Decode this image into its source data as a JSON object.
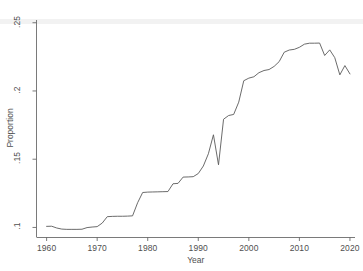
{
  "chart_data": {
    "type": "line",
    "title": "",
    "xlabel": "Year",
    "ylabel": "Proportion",
    "xlim": [
      1958,
      2021
    ],
    "ylim": [
      0.093,
      0.252
    ],
    "grid": false,
    "legend": null,
    "xticks": [
      "1960",
      "1970",
      "1980",
      "1990",
      "2000",
      "2010",
      "2020"
    ],
    "xtick_values": [
      1960,
      1970,
      1980,
      1990,
      2000,
      2010,
      2020
    ],
    "yticks": [
      ".1",
      ".15",
      ".2",
      ".25"
    ],
    "ytick_values": [
      0.1,
      0.15,
      0.2,
      0.25
    ],
    "series": [
      {
        "name": "Proportion",
        "color": "#5a5a5a",
        "x": [
          1960,
          1961,
          1962,
          1963,
          1964,
          1965,
          1966,
          1967,
          1968,
          1969,
          1970,
          1971,
          1972,
          1973,
          1974,
          1975,
          1976,
          1977,
          1978,
          1979,
          1980,
          1981,
          1982,
          1983,
          1984,
          1985,
          1986,
          1987,
          1988,
          1989,
          1990,
          1991,
          1992,
          1993,
          1994,
          1995,
          1996,
          1997,
          1998,
          1999,
          2000,
          2001,
          2002,
          2003,
          2004,
          2005,
          2006,
          2007,
          2008,
          2009,
          2010,
          2011,
          2012,
          2013,
          2014,
          2015,
          2016,
          2017,
          2018,
          2019,
          2020
        ],
        "values": [
          0.1008,
          0.1009,
          0.0996,
          0.0988,
          0.0986,
          0.0986,
          0.0986,
          0.0987,
          0.0999,
          0.1003,
          0.1006,
          0.1032,
          0.1079,
          0.1081,
          0.1082,
          0.1082,
          0.1083,
          0.1085,
          0.1181,
          0.1256,
          0.1259,
          0.126,
          0.1261,
          0.1262,
          0.1263,
          0.132,
          0.1323,
          0.1369,
          0.137,
          0.1372,
          0.1395,
          0.145,
          0.154,
          0.1679,
          0.1459,
          0.1793,
          0.182,
          0.1828,
          0.1918,
          0.2075,
          0.2094,
          0.2104,
          0.2134,
          0.215,
          0.2157,
          0.218,
          0.2215,
          0.2284,
          0.23,
          0.2305,
          0.232,
          0.2343,
          0.235,
          0.235,
          0.2351,
          0.226,
          0.2301,
          0.2244,
          0.2118,
          0.2186,
          0.2125
        ]
      }
    ]
  },
  "axes": {
    "y_title": "Proportion",
    "x_title": "Year"
  }
}
